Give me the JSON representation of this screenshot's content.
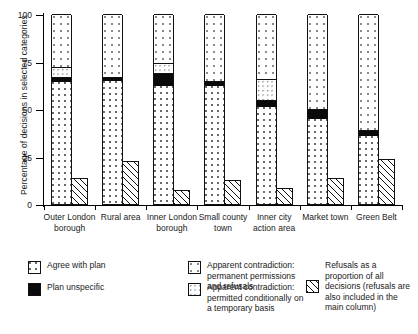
{
  "chart_data": {
    "type": "bar",
    "title": "",
    "xlabel": "",
    "ylabel": "Percentage of decisions in selected categories",
    "ylim": [
      0,
      100
    ],
    "yticks": [
      0,
      25,
      50,
      75,
      100
    ],
    "grid": false,
    "legend_position": "bottom",
    "stacked": true,
    "categories": [
      "Outer London borough",
      "Rural area",
      "Inner London borough",
      "Small county town",
      "Inner city action area",
      "Market town",
      "Green Belt"
    ],
    "series": [
      {
        "name": "Agree with plan",
        "key": "agree",
        "values": [
          64,
          65,
          62,
          62,
          51,
          45,
          36
        ]
      },
      {
        "name": "Apparent contradiction: permanent permissions and refusals",
        "key": "permanent",
        "values": [
          3,
          2,
          7,
          3,
          4,
          5,
          3
        ]
      },
      {
        "name": "Apparent contradiction: permitted conditionally on a temporary basis",
        "key": "temporary",
        "values": [
          5,
          0,
          5,
          0,
          11,
          0,
          0
        ]
      },
      {
        "name": "Plan unspecific",
        "key": "unspecific",
        "values": [
          28,
          33,
          26,
          35,
          34,
          50,
          61
        ]
      }
    ],
    "refusals": {
      "name": "Refusals as a proportion of all decisions (refusals are also included in the main column)",
      "key": "refusals",
      "values": [
        14,
        23,
        8,
        13,
        9,
        14,
        24
      ]
    }
  },
  "axis": {
    "y_title": "Percentage of decisions in selected categories",
    "y_tick_labels": [
      "100",
      "75",
      "50",
      "25",
      "0"
    ]
  },
  "legend": {
    "items": [
      {
        "pattern": "agree",
        "label": "Agree with plan"
      },
      {
        "pattern": "permanent",
        "label": "Apparent contradiction: permanent permissions and refusals"
      },
      {
        "pattern": "unspecific",
        "label": "Plan unspecific"
      },
      {
        "pattern": "temporary",
        "label": "Apparent contradiction: permitted conditionally on a temporary basis"
      },
      {
        "pattern": "refusals",
        "label": "Refusals as a proportion of all decisions (refusals are also included in the main column)"
      }
    ]
  }
}
